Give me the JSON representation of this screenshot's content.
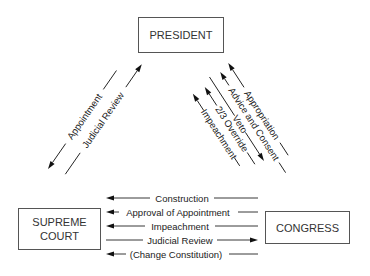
{
  "diagram": {
    "nodes": {
      "president": {
        "label": "PRESIDENT"
      },
      "supreme_court": {
        "line1": "SUPREME",
        "line2": "COURT"
      },
      "congress": {
        "label": "CONGRESS"
      }
    },
    "president_court": [
      {
        "label": "Appointment",
        "from": "PRESIDENT",
        "to": "SUPREME COURT"
      },
      {
        "label": "Judicial Review",
        "from": "SUPREME COURT",
        "to": "PRESIDENT"
      }
    ],
    "president_congress": [
      {
        "label": "Appropriation",
        "from": "CONGRESS",
        "to": "PRESIDENT"
      },
      {
        "label": "Advice and Consent",
        "from": "CONGRESS",
        "to": "PRESIDENT"
      },
      {
        "label": "Veto",
        "from": "PRESIDENT",
        "to": "CONGRESS"
      },
      {
        "label": "2/3 Override",
        "from": "CONGRESS",
        "to": "PRESIDENT"
      },
      {
        "label": "Impeachment",
        "from": "CONGRESS",
        "to": "PRESIDENT"
      }
    ],
    "court_congress": [
      {
        "label": "Construction",
        "from": "CONGRESS",
        "to": "SUPREME COURT"
      },
      {
        "label": "Approval of Appointment",
        "from": "CONGRESS",
        "to": "SUPREME COURT"
      },
      {
        "label": "Impeachment",
        "from": "CONGRESS",
        "to": "SUPREME COURT"
      },
      {
        "label": "Judicial Review",
        "from": "SUPREME COURT",
        "to": "CONGRESS"
      },
      {
        "label": "(Change Constitution)",
        "from": "CONGRESS",
        "to": "SUPREME COURT"
      }
    ]
  }
}
